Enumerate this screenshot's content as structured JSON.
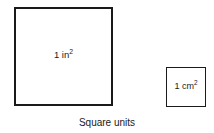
{
  "figure": {
    "caption": "Square units",
    "background_color": "#ffffff",
    "stroke_color": "#1a1a1a",
    "shapes": [
      {
        "name": "square-inch",
        "shape": "square",
        "label_value": "1",
        "label_unit": "in",
        "label_exponent": "2",
        "label_full": "1 in2"
      },
      {
        "name": "square-centimeter",
        "shape": "square",
        "label_value": "1",
        "label_unit": "cm",
        "label_exponent": "2",
        "label_full": "1 cm2"
      }
    ]
  }
}
